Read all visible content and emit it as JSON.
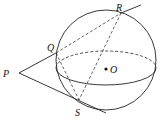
{
  "diagram": {
    "type": "geometry-sphere-tangents",
    "labels": {
      "P": "P",
      "Q": "Q",
      "R": "R",
      "S": "S",
      "O": "O"
    },
    "points": {
      "P": [
        19,
        73
      ],
      "Q": [
        56,
        53
      ],
      "R": [
        121,
        13
      ],
      "S": [
        79,
        100
      ],
      "O": [
        106,
        69
      ]
    },
    "sphere": {
      "cx": 106,
      "cy": 60,
      "r": 50
    },
    "equator": {
      "cx": 106,
      "cy": 68,
      "rx": 50,
      "ry": 17
    },
    "colors": {
      "stroke": "#222222",
      "background": "#ffffff"
    }
  }
}
